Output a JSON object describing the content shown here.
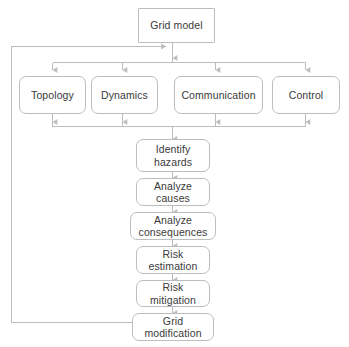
{
  "diagram": {
    "background_color": "#ffffff",
    "stroke_color": "#bdbdbd",
    "text_color": "#3a3a3a",
    "nodes": {
      "grid_model": "Grid model",
      "topology": "Topology",
      "dynamics": "Dynamics",
      "communication": "Communication",
      "control": "Control",
      "identify_hazards": "Identify\nhazards",
      "analyze_causes": "Analyze\ncauses",
      "analyze_consequences": "Analyze\nconsequences",
      "risk_estimation": "Risk\nestimation",
      "risk_mitigation": "Risk\nmitigation",
      "grid_modification": "Grid\nmodification"
    }
  }
}
